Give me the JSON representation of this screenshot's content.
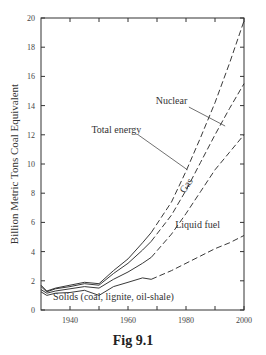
{
  "chart_data": {
    "type": "line",
    "title": "",
    "caption": "Fig 9.1",
    "xlabel": "",
    "ylabel": "Billion Metric Tons Coal Equivalent",
    "xlim": [
      1930,
      2000
    ],
    "ylim": [
      0,
      20
    ],
    "x_ticks": [
      1940,
      1960,
      1980,
      2000
    ],
    "x_minor_ticks": [
      1950,
      1970,
      1990
    ],
    "y_ticks": [
      0,
      2,
      4,
      6,
      8,
      10,
      12,
      14,
      16,
      18,
      20
    ],
    "grid": false,
    "legend": "inline labels",
    "note": "Solid lines = historical data (to ~1968); dashed lines = projections to 2000",
    "series": [
      {
        "name": "Nuclear",
        "description": "Top curve (total including nuclear)",
        "x": [
          1930,
          1932,
          1935,
          1940,
          1945,
          1950,
          1955,
          1960,
          1965,
          1968,
          1975,
          1980,
          1985,
          1990,
          1995,
          2000
        ],
        "values": [
          1.7,
          1.3,
          1.5,
          1.7,
          1.9,
          1.8,
          2.7,
          3.5,
          4.6,
          5.3,
          7.4,
          9.5,
          11.8,
          14.2,
          16.9,
          19.8
        ]
      },
      {
        "name": "Total energy",
        "description": "Second curve",
        "x": [
          1930,
          1932,
          1935,
          1940,
          1945,
          1950,
          1955,
          1960,
          1965,
          1968,
          1975,
          1980,
          1985,
          1990,
          1995,
          2000
        ],
        "values": [
          1.6,
          1.25,
          1.45,
          1.6,
          1.8,
          1.7,
          2.5,
          3.2,
          4.1,
          4.7,
          6.5,
          8.2,
          10.1,
          12.0,
          13.8,
          15.5
        ]
      },
      {
        "name": "Gas",
        "description": "Third curve (boundary between gas and liquid fuel)",
        "x": [
          1930,
          1932,
          1935,
          1940,
          1945,
          1950,
          1955,
          1960,
          1965,
          1968,
          1975,
          1980,
          1985,
          1990,
          1995,
          2000
        ],
        "values": [
          1.4,
          1.15,
          1.3,
          1.45,
          1.6,
          1.5,
          2.1,
          2.6,
          3.2,
          3.6,
          5.2,
          6.6,
          8.1,
          9.6,
          10.8,
          12.0
        ]
      },
      {
        "name": "Liquid fuel",
        "description": "Fourth curve (top of solids region)",
        "x": [
          1930,
          1932,
          1935,
          1940,
          1945,
          1950,
          1955,
          1960,
          1965,
          1968,
          1975,
          1980,
          1985,
          1990,
          1995,
          2000
        ],
        "values": [
          1.25,
          1.0,
          1.15,
          1.2,
          1.35,
          1.0,
          1.6,
          1.9,
          2.2,
          2.1,
          2.7,
          3.2,
          3.7,
          4.2,
          4.6,
          5.1
        ]
      }
    ],
    "labels": [
      {
        "text": "Nuclear",
        "x": 1975,
        "y": 14.1
      },
      {
        "text": "Total energy",
        "x": 1956,
        "y": 12.1
      },
      {
        "text": "Gas",
        "x": 1981,
        "y": 8.4,
        "rotation": -55
      },
      {
        "text": "Liquid fuel",
        "x": 1984,
        "y": 5.6
      },
      {
        "text": "Solids (coal, lignite, oil-shale)",
        "x": 1955,
        "y": 0.7
      }
    ]
  }
}
